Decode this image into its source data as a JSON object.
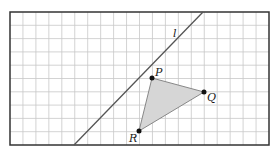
{
  "grid": {
    "columns": 20,
    "rows": 10,
    "border_color": "#333333",
    "line_color": "#c8c8c8"
  },
  "line": {
    "label": "l",
    "color": "#555555"
  },
  "triangle": {
    "fill": "#d6d6d6",
    "stroke": "#888888",
    "points": [
      {
        "name": "P",
        "label": "P",
        "grid_x": 11,
        "grid_y": 5
      },
      {
        "name": "Q",
        "label": "Q",
        "grid_x": 15,
        "grid_y": 6
      },
      {
        "name": "R",
        "label": "R",
        "grid_x": 10,
        "grid_y": 9
      }
    ]
  }
}
